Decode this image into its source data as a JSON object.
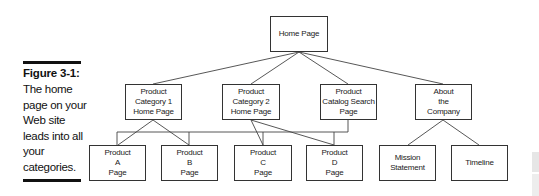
{
  "caption": {
    "title": "Figure 3-1:",
    "body": "The home page on your Web site leads into all your categories."
  },
  "diagram": {
    "root": {
      "label": "Home Page"
    },
    "level1": [
      {
        "id": "cat1",
        "label": "Product\nCategory 1\nHome Page"
      },
      {
        "id": "cat2",
        "label": "Product\nCategory 2\nHome Page"
      },
      {
        "id": "search",
        "label": "Product\nCatalog Search\nPage"
      },
      {
        "id": "about",
        "label": "About\nthe\nCompany"
      }
    ],
    "level2": [
      {
        "id": "a",
        "label": "Product\nA\nPage"
      },
      {
        "id": "b",
        "label": "Product\nB\nPage"
      },
      {
        "id": "c",
        "label": "Product\nC\nPage"
      },
      {
        "id": "d",
        "label": "Product\nD\nPage"
      },
      {
        "id": "mission",
        "label": "Mission\nStatement"
      },
      {
        "id": "timeline",
        "label": "Timeline"
      }
    ],
    "colors": {
      "line": "#444444",
      "border": "#333333",
      "text": "#222222"
    }
  }
}
